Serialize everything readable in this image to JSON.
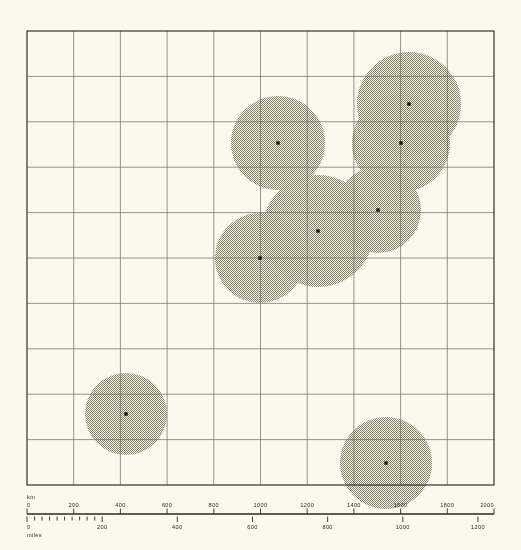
{
  "figure": {
    "type": "map-distribution-diagram",
    "background_color": "#fbf9ee",
    "ink_color": "#2b2a22"
  },
  "plot_frame": {
    "x": 27,
    "y": 31,
    "width": 467,
    "height": 454,
    "grid_cols": 10,
    "grid_rows": 10,
    "border_color": "#33322a",
    "grid_color": "#6b6a5e"
  },
  "chart_data": {
    "type": "scatter",
    "title": "",
    "xlabel": "",
    "ylabel": "",
    "grid": true,
    "legend": "none",
    "xlim": [
      0,
      2000
    ],
    "ylim": [
      0,
      1945
    ],
    "units_primary": "km",
    "units_secondary": "miles",
    "point_marker": "small black square",
    "circle_fill": "#9b998e",
    "circle_style": "halftone stipple, multiply blending",
    "series": [
      {
        "name": "sites",
        "points": [
          {
            "id": "site-1",
            "cx": 278,
            "cy": 143,
            "r": 47
          },
          {
            "id": "site-2",
            "cx": 409,
            "cy": 104,
            "r": 52
          },
          {
            "id": "site-3",
            "cx": 401,
            "cy": 143,
            "r": 49
          },
          {
            "id": "site-4",
            "cx": 378,
            "cy": 210,
            "r": 43
          },
          {
            "id": "site-5",
            "cx": 318,
            "cy": 231,
            "r": 56
          },
          {
            "id": "site-6",
            "cx": 260,
            "cy": 258,
            "r": 45
          },
          {
            "id": "site-7",
            "cx": 126,
            "cy": 414,
            "r": 41
          },
          {
            "id": "site-8",
            "cx": 386,
            "cy": 463,
            "r": 46
          }
        ]
      }
    ]
  },
  "scale_bar": {
    "km": {
      "unit_label": "km",
      "x_start": 27,
      "x_end": 494,
      "max_value": 2000,
      "labels": [
        "0",
        "200",
        "400",
        "600",
        "800",
        "1000",
        "1200",
        "1400",
        "1600",
        "1800",
        "2000"
      ],
      "values": [
        0,
        200,
        400,
        600,
        800,
        1000,
        1200,
        1400,
        1600,
        1800,
        2000
      ]
    },
    "miles": {
      "unit_label": "miles",
      "max_value": 1200,
      "km_per_mile": 1.609344,
      "labels": [
        "0",
        "200",
        "400",
        "600",
        "800",
        "1000",
        "1200"
      ],
      "values": [
        0,
        200,
        400,
        600,
        800,
        1000,
        1200
      ],
      "minor_ticks": [
        20,
        40,
        60,
        80,
        100,
        120,
        140,
        160,
        180
      ]
    }
  }
}
